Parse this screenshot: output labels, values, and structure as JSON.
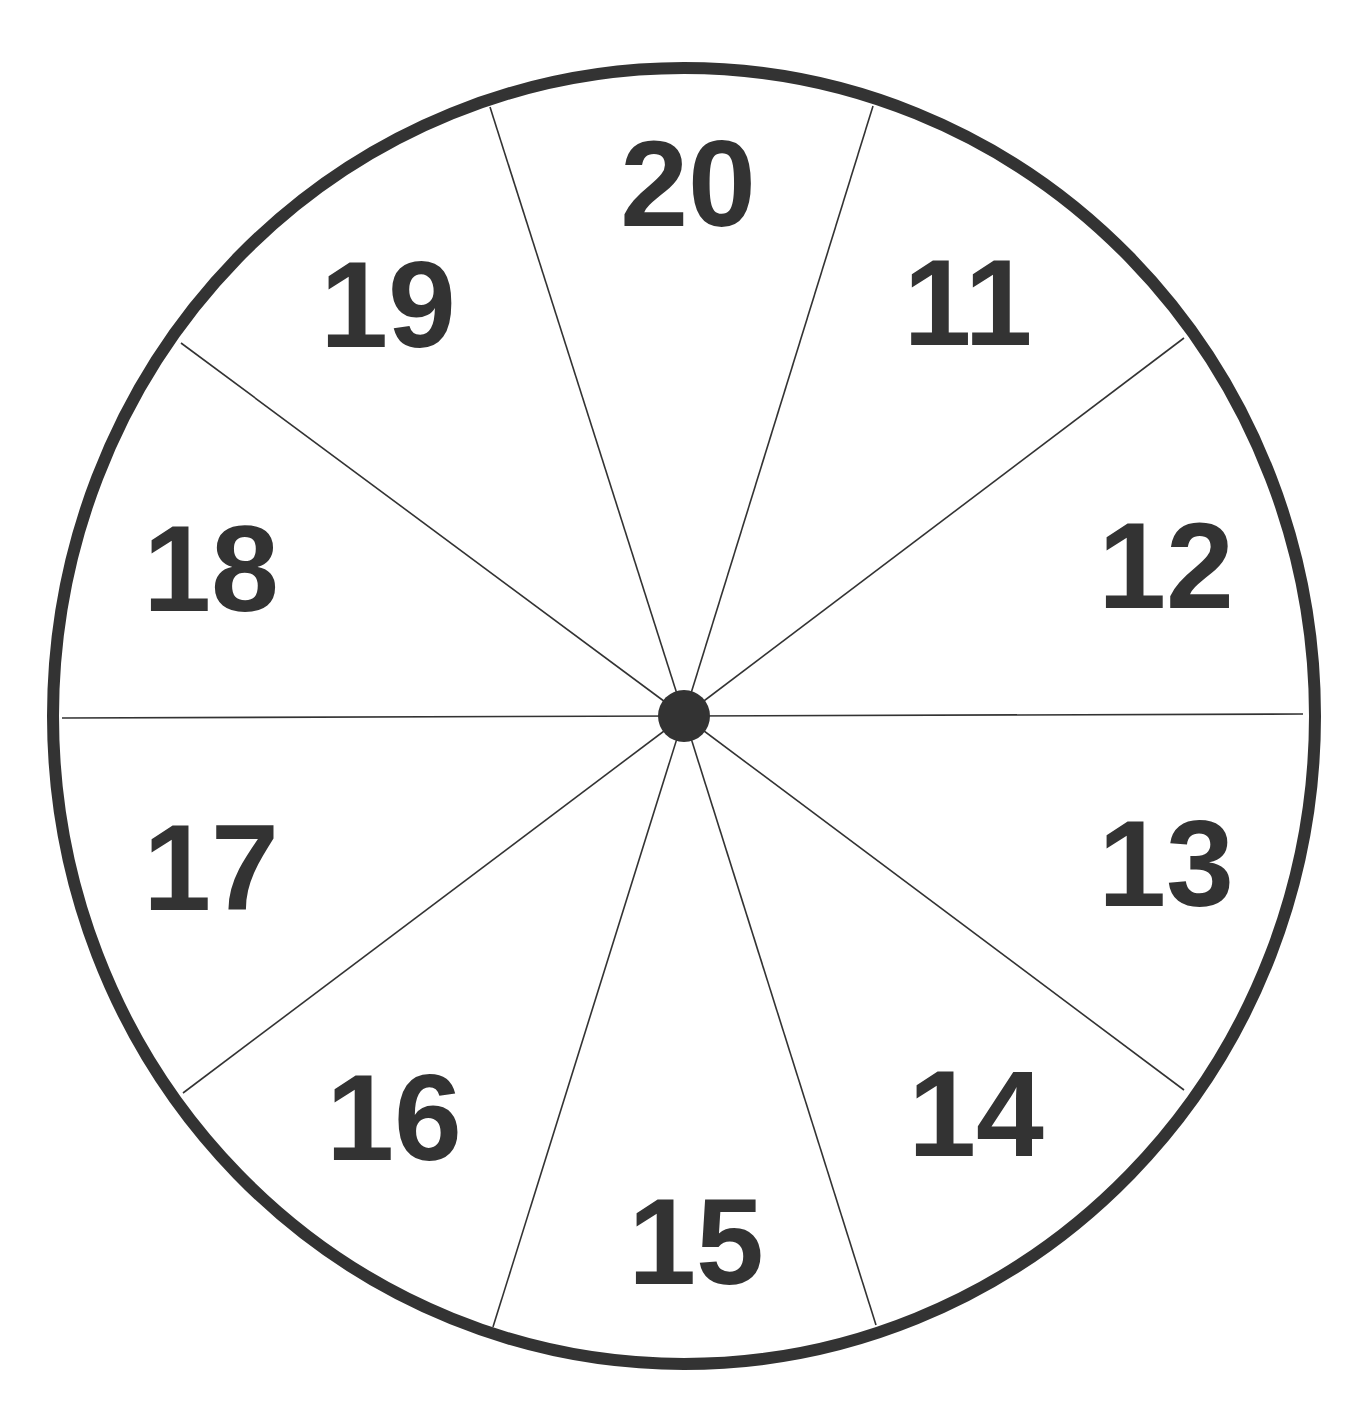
{
  "diagram": {
    "type": "spinner-wheel",
    "segment_count": 10,
    "colors": {
      "stroke": "#333333",
      "background": "#ffffff"
    },
    "segments": [
      {
        "label": "20",
        "position": "top"
      },
      {
        "label": "11",
        "position": "top-right"
      },
      {
        "label": "12",
        "position": "right-upper"
      },
      {
        "label": "13",
        "position": "right-lower"
      },
      {
        "label": "14",
        "position": "bottom-right"
      },
      {
        "label": "15",
        "position": "bottom"
      },
      {
        "label": "16",
        "position": "bottom-left"
      },
      {
        "label": "17",
        "position": "left-lower"
      },
      {
        "label": "18",
        "position": "left-upper"
      },
      {
        "label": "19",
        "position": "top-left"
      }
    ]
  }
}
